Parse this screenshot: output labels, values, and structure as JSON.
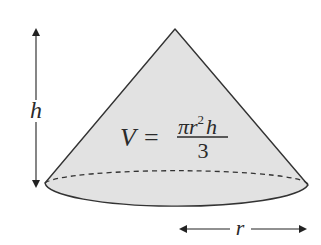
{
  "diagram": {
    "colors": {
      "fill": "#e2e2e2",
      "stroke": "#333333",
      "text": "#2a2a2a",
      "background": "#ffffff"
    },
    "height_label": "h",
    "radius_label": "r",
    "formula": {
      "lhs": "V",
      "equals": "=",
      "numerator_pi": "π",
      "numerator_r": "r",
      "numerator_exp": "2",
      "numerator_h": "h",
      "denominator": "3"
    }
  }
}
